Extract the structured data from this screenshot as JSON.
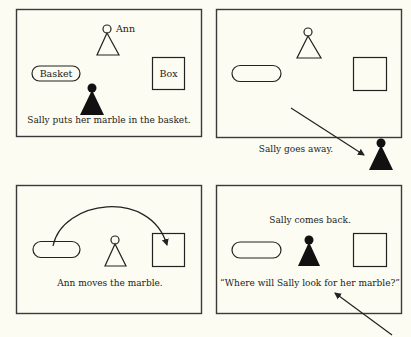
{
  "colors": {
    "background": "#fcfcf2",
    "ink": "#222222",
    "frame": "#3a3a3a"
  },
  "panels": [
    {
      "id": "panel-1",
      "caption": "Sally puts her marble in the basket.",
      "labels": {
        "ann": "Ann",
        "basket": "Basket",
        "box": "Box"
      }
    },
    {
      "id": "panel-2",
      "caption": "Sally goes away."
    },
    {
      "id": "panel-3",
      "caption": "Ann moves the marble."
    },
    {
      "id": "panel-4",
      "caption": "Sally comes back.",
      "question": "“Where will Sally look for her marble?”"
    }
  ],
  "icons": {
    "ann": "outline-pawn-icon",
    "sally": "filled-pawn-icon",
    "basket": "pill-shape",
    "box": "square-shape",
    "arrow": "arrow-icon"
  }
}
